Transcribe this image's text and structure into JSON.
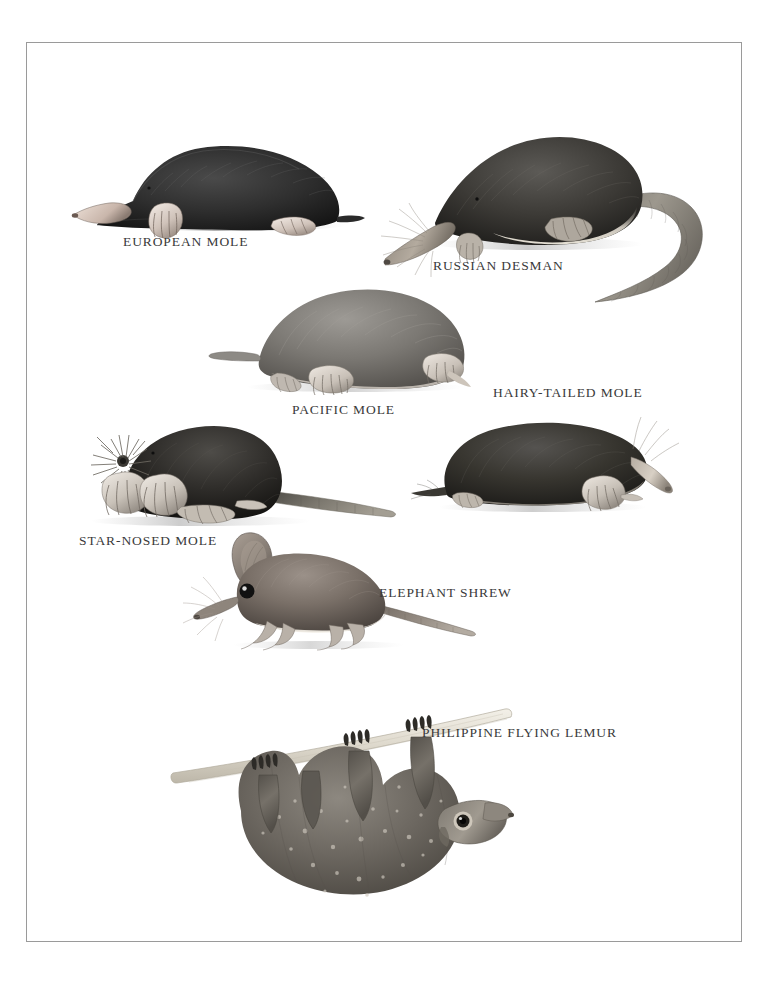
{
  "plate": {
    "title": "Moles, Shrews and Allied Insectivores",
    "background_color": "#ffffff",
    "frame_color": "#9a9a9a",
    "caption_color": "#3a3a3a"
  },
  "figures": [
    {
      "id": "european-mole",
      "label": "EUROPEAN MOLE",
      "caption_x": 122,
      "caption_y": 233,
      "fig_x": 60,
      "fig_y": 108,
      "fig_w": 300,
      "fig_h": 120,
      "body_color": "#2b2b2b",
      "facing": "left",
      "notes": "Stout black mole facing left, pink pointed snout, large pale forepaw, short tail"
    },
    {
      "id": "russian-desman",
      "label": "RUSSIAN DESMAN",
      "caption_x": 432,
      "caption_y": 257,
      "fig_x": 372,
      "fig_y": 102,
      "fig_w": 335,
      "fig_h": 200,
      "body_color": "#3a3a3a",
      "facing": "left",
      "notes": "Dark brown body with pale belly, long flattened snout with whiskers, long curving scaly tail sweeping right then down"
    },
    {
      "id": "pacific-mole",
      "label": "PACIFIC MOLE",
      "caption_x": 291,
      "caption_y": 401,
      "fig_x": 205,
      "fig_y": 268,
      "fig_w": 275,
      "fig_h": 120,
      "body_color": "#6e6e6e",
      "facing": "right",
      "notes": "Mid-grey mole facing right, clawed forepaws spread, short tapered tail to left"
    },
    {
      "id": "hairy-tailed-mole",
      "label": "HAIRY-TAILED MOLE",
      "caption_x": 492,
      "caption_y": 384,
      "fig_x": 424,
      "fig_y": 408,
      "fig_w": 250,
      "fig_h": 105,
      "body_color": "#2f2f2f",
      "facing": "right",
      "notes": "Dark elongated mole facing right, long pale snout, stiff hairs on tail, clawed forefoot"
    },
    {
      "id": "star-nosed-mole",
      "label": "STAR-NOSED MOLE",
      "caption_x": 78,
      "caption_y": 532,
      "fig_x": 60,
      "fig_y": 418,
      "fig_w": 330,
      "fig_h": 105,
      "body_color": "#2a2a2a",
      "facing": "left",
      "notes": "Black mole with radiating fleshy star tentacles on the snout, broad digging forepaws, long bare tail to the right"
    },
    {
      "id": "elephant-shrew",
      "label": "ELEPHANT SHREW",
      "caption_x": 378,
      "caption_y": 584,
      "fig_x": 188,
      "fig_y": 528,
      "fig_w": 270,
      "fig_h": 115,
      "body_color": "#7d7168",
      "facing": "left",
      "notes": "Mouse-like animal with very large rounded ear, large black eye, long tapering trunk-like snout with whiskers, slender legs and long tail trailing right"
    },
    {
      "id": "philippine-flying-lemur",
      "label": "PHILIPPINE FLYING LEMUR",
      "caption_x": 421,
      "caption_y": 724,
      "fig_x": 150,
      "fig_y": 655,
      "fig_w": 360,
      "fig_h": 240,
      "body_color": "#6b6b6b",
      "facing": "right",
      "notes": "Colugo hanging upside down beneath a pale horizontal branch, four clawed hands gripping the branch, speckled gliding membrane, blunt head with dark-ringed eye at lower right"
    }
  ],
  "branch": {
    "color": "#dedacf",
    "x1": 152,
    "y1": 730,
    "x2": 500,
    "y2": 663
  }
}
